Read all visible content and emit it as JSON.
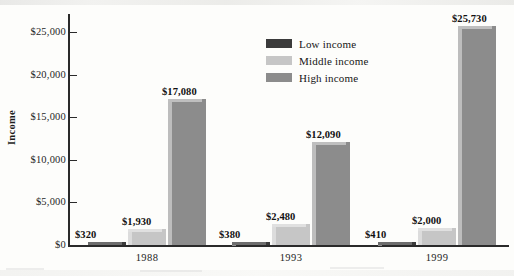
{
  "chart_data": {
    "type": "bar",
    "title": "",
    "subtitle": "",
    "xlabel": "",
    "ylabel": "Income",
    "categories": [
      "1988",
      "1993",
      "1999"
    ],
    "series": [
      {
        "name": "Low income",
        "color": "#3b3b3b",
        "values": [
          320,
          380,
          410
        ],
        "labels": [
          "$320",
          "$380",
          "$410"
        ]
      },
      {
        "name": "Middle income",
        "color": "#c6c6c6",
        "values": [
          1930,
          2480,
          2000
        ],
        "labels": [
          "$1,930",
          "$2,480",
          "$2,000"
        ]
      },
      {
        "name": "High income",
        "color": "#8c8c8c",
        "values": [
          17080,
          12090,
          25730
        ],
        "labels": [
          "$17,080",
          "$12,090",
          "$25,730"
        ]
      }
    ],
    "ylim": [
      0,
      27000
    ],
    "yticks": [
      0,
      5000,
      10000,
      15000,
      20000,
      25000
    ],
    "ytick_labels": [
      "$0",
      "$5,000",
      "$10,000",
      "$15,000",
      "$20,000",
      "$25,000"
    ],
    "grid": false,
    "legend_position": "upper-center",
    "bar_style": "3d-extruded",
    "value_labels_shown": true
  },
  "axis": {
    "y_title": "Income"
  },
  "legend": {
    "items": [
      {
        "label": "Low income",
        "swatch": "legend-swatch-low"
      },
      {
        "label": "Middle income",
        "swatch": "legend-swatch-middle"
      },
      {
        "label": "High income",
        "swatch": "legend-swatch-high"
      }
    ]
  }
}
